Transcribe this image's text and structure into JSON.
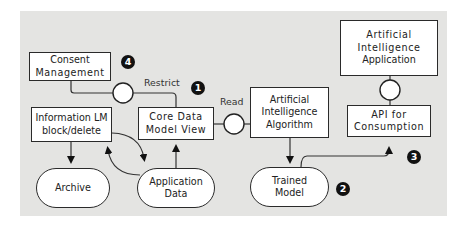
{
  "nodes": {
    "consent": {
      "line1": "Consent",
      "line2": "Management"
    },
    "info_lm": {
      "line1": "Information LM",
      "line2": "block/delete"
    },
    "archive": {
      "line1": "Archive"
    },
    "app_data": {
      "line1": "Application",
      "line2": "Data"
    },
    "core_data": {
      "line1": "Core Data",
      "line2": "Model View"
    },
    "ai_algorithm": {
      "line1": "Artificial",
      "line2": "Intelligence",
      "line3": "Algorithm"
    },
    "trained_model": {
      "line1": "Trained",
      "line2": "Model"
    },
    "api": {
      "line1": "API for",
      "line2": "Consumption"
    },
    "ai_app": {
      "line1": "Artificial",
      "line2": "Intelligence",
      "line3": "Application"
    }
  },
  "labels": {
    "restrict": "Restrict",
    "read": "Read"
  },
  "badges": {
    "b1": "1",
    "b2": "2",
    "b3": "3",
    "b4": "4"
  },
  "colors": {
    "background": "#e4e4e2",
    "stroke": "#2a2a2a",
    "badge": "#111111"
  }
}
